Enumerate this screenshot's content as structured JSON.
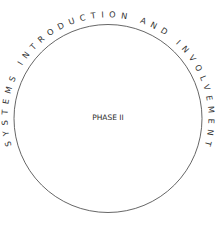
{
  "diagram": {
    "arc_text": "SYSTEMS  INTRODUCTION   AND   INVOLVEMENT",
    "center_text": "PHASE II",
    "colors": {
      "stroke": "#555555",
      "text": "#333333",
      "background": "#ffffff"
    }
  }
}
